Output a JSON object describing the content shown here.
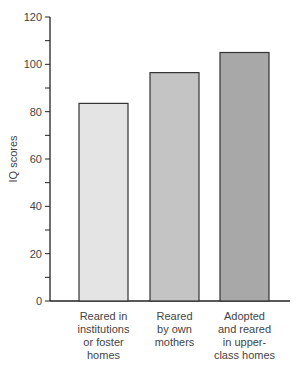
{
  "chart_data": {
    "type": "bar",
    "title": "",
    "xlabel": "",
    "ylabel": "IQ scores",
    "ylim": [
      0,
      120
    ],
    "yticks": [
      0,
      20,
      40,
      60,
      80,
      100,
      120
    ],
    "grid": false,
    "categories": [
      [
        "Reared in",
        "institutions",
        "or foster",
        "homes"
      ],
      [
        "Reared",
        "by own",
        "mothers"
      ],
      [
        "Adopted",
        "and reared",
        "in upper-",
        "class homes"
      ]
    ],
    "category_labels": [
      "Reared in institutions or foster homes",
      "Reared by own mothers",
      "Adopted and reared in upper-class homes"
    ],
    "values": [
      83.5,
      96.5,
      105
    ],
    "colors": [
      "#e4e4e4",
      "#c4c4c4",
      "#a8a8a8"
    ]
  }
}
